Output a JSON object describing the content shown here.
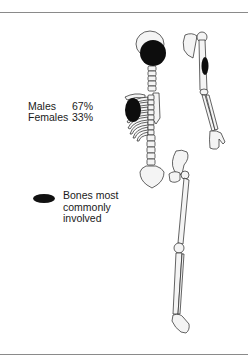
{
  "figure": {
    "type": "skeleton-diagram",
    "stats": [
      {
        "label": "Males",
        "value": "67%"
      },
      {
        "label": "Females",
        "value": "33%"
      }
    ],
    "legend": {
      "symbol": "black-ellipse",
      "label": "Bones most commonly involved"
    },
    "involved_sites": [
      "skull",
      "ribs",
      "humerus"
    ],
    "colors": {
      "lesion": "#0d0d0d",
      "bone_fill": "#f4f4f4",
      "outline": "#222222",
      "rule": "#8a8a8a"
    }
  }
}
